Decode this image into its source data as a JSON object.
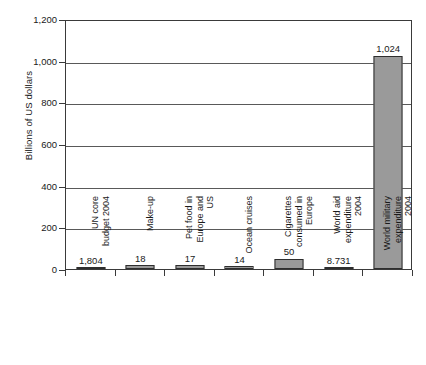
{
  "chart_data": {
    "type": "bar",
    "title": "",
    "subtitle": "",
    "xlabel": "",
    "ylabel": "Billions of US dollars",
    "ylim": [
      0,
      1200
    ],
    "yticks": [
      0,
      200,
      400,
      600,
      800,
      1000,
      1200
    ],
    "ytick_labels": [
      "0",
      "200",
      "400",
      "600",
      "800",
      "1,000",
      "1,200"
    ],
    "grid": true,
    "legend": "none",
    "bar_color": "#9a9a9a",
    "bar_border_color": "#2e2e2e",
    "axis_color": "#3a3a3a",
    "categories": [
      "UN core budget 2004",
      "Make-up",
      "Pet food in Europe and US",
      "Ocean cruises",
      "Cigarettes consumed in Europe",
      "World aid expenditure 2004",
      "World military expenditure 2004"
    ],
    "category_lines": [
      [
        "UN core",
        "budget 2004"
      ],
      [
        "Make-up"
      ],
      [
        "Pet food in",
        "Europe and",
        "US"
      ],
      [
        "Ocean cruises"
      ],
      [
        "Cigarettes",
        "consumed in",
        "Europe"
      ],
      [
        "World aid",
        "expenditure",
        "2004"
      ],
      [
        "World military",
        "expenditure",
        "2004"
      ]
    ],
    "data_labels": [
      "1,804",
      "18",
      "17",
      "14",
      "50",
      "8.731",
      "1,024"
    ],
    "values": [
      1.804,
      18,
      17,
      14,
      50,
      8.731,
      1024
    ]
  }
}
